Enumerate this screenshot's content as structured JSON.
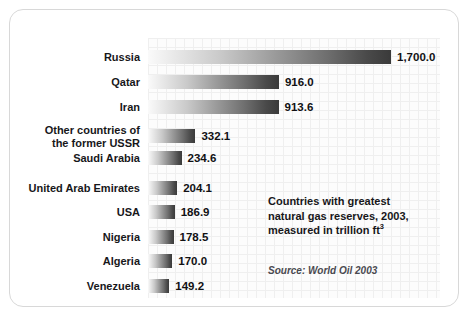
{
  "chart_data": {
    "type": "bar",
    "orientation": "horizontal",
    "title": "Countries with greatest natural gas reserves, 2003, measured in trillion ft3",
    "xlabel": "",
    "ylabel": "",
    "unit": "trillion ft3",
    "year": "2003",
    "grid": true,
    "legend": "none",
    "xlim": [
      0,
      1700
    ],
    "categories": [
      "Russia",
      "Qatar",
      "Iran",
      "Other countries of the former USSR",
      "Saudi Arabia",
      "United Arab Emirates",
      "USA",
      "Nigeria",
      "Algeria",
      "Venezuela"
    ],
    "values": [
      1700.0,
      916.0,
      913.6,
      332.1,
      234.6,
      204.1,
      186.9,
      178.5,
      170.0,
      149.2
    ],
    "value_labels": [
      "1,700.0",
      "916.0",
      "913.6",
      "332.1",
      "234.6",
      "204.1",
      "186.9",
      "178.5",
      "170.0",
      "149.2"
    ]
  },
  "rows": [
    {
      "label": "Russia",
      "label_line1": "Russia",
      "label_line2": "",
      "value_label": "1,700.0",
      "value": 1700.0
    },
    {
      "label": "Qatar",
      "label_line1": "Qatar",
      "label_line2": "",
      "value_label": "916.0",
      "value": 916.0
    },
    {
      "label": "Iran",
      "label_line1": "Iran",
      "label_line2": "",
      "value_label": "913.6",
      "value": 913.6
    },
    {
      "label": "Other countries of the former USSR",
      "label_line1": "Other countries of",
      "label_line2": "the former USSR",
      "value_label": "332.1",
      "value": 332.1
    },
    {
      "label": "Saudi Arabia",
      "label_line1": "Saudi Arabia",
      "label_line2": "",
      "value_label": "234.6",
      "value": 234.6
    },
    {
      "label": "United Arab Emirates",
      "label_line1": "United Arab Emirates",
      "label_line2": "",
      "value_label": "204.1",
      "value": 204.1
    },
    {
      "label": "USA",
      "label_line1": "USA",
      "label_line2": "",
      "value_label": "186.9",
      "value": 186.9
    },
    {
      "label": "Nigeria",
      "label_line1": "Nigeria",
      "label_line2": "",
      "value_label": "178.5",
      "value": 178.5
    },
    {
      "label": "Algeria",
      "label_line1": "Algeria",
      "label_line2": "",
      "value_label": "170.0",
      "value": 170.0
    },
    {
      "label": "Venezuela",
      "label_line1": "Venezuela",
      "label_line2": "",
      "value_label": "149.2",
      "value": 149.2
    }
  ],
  "caption": {
    "line1": "Countries with greatest",
    "line2": "natural gas reserves, 2003,",
    "line3_pre": "measured in trillion ft",
    "line3_sup": "3"
  },
  "source": {
    "text": "Source: World Oil 2003"
  },
  "colors": {
    "bar_gradient_start": "#fafafa",
    "bar_gradient_end": "#3a3a3a",
    "text": "#17171a",
    "grid_line": "#efefef",
    "frame_border": "#d8d8d8",
    "page_background": "#ffffff",
    "source_text": "#4a4a50"
  }
}
